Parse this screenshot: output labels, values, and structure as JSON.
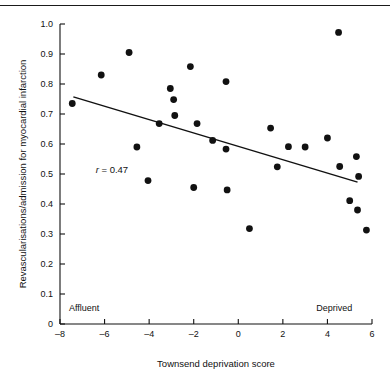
{
  "figure": {
    "has_top_rule": true,
    "background_color": "#ffffff",
    "ink_color": "#111111"
  },
  "chart_data": {
    "type": "scatter",
    "title": "",
    "xlabel": "Townsend deprivation score",
    "ylabel": "Revascularisations/admission for myocardial infarction",
    "xlim": [
      -8,
      6
    ],
    "ylim": [
      0,
      1.0
    ],
    "xticks": [
      -8,
      -6,
      -4,
      -2,
      0,
      2,
      4,
      6
    ],
    "xtick_labels": [
      "–8",
      "–6",
      "–4",
      "–2",
      "0",
      "2",
      "4",
      "6"
    ],
    "yticks": [
      0,
      0.1,
      0.2,
      0.3,
      0.4,
      0.5,
      0.6,
      0.7,
      0.8,
      0.9,
      1.0
    ],
    "ytick_labels": [
      "0",
      "0.1",
      "0.2",
      "0.3",
      "0.4",
      "0.5",
      "0.6",
      "0.7",
      "0.8",
      "0.9",
      "1.0"
    ],
    "grid": false,
    "legend": null,
    "marker": {
      "shape": "circle",
      "color": "#111111",
      "radius_px": 3.4
    },
    "annotations": [
      {
        "name": "correlation-annotation",
        "text_italic": "r",
        "text": " = 0.47",
        "x": -6.4,
        "y": 0.515
      },
      {
        "name": "affluent-label",
        "text": "Affluent",
        "x": -7.6,
        "y": 0.055
      },
      {
        "name": "deprived-label",
        "text": "Deprived",
        "x": 3.5,
        "y": 0.055
      }
    ],
    "trendline": {
      "name": "regression-line",
      "color": "#111111",
      "x_start": -7.4,
      "y_start": 0.757,
      "x_end": 5.35,
      "y_end": 0.473
    },
    "points": [
      {
        "x": -7.45,
        "y": 0.735
      },
      {
        "x": -6.15,
        "y": 0.83
      },
      {
        "x": -4.9,
        "y": 0.905
      },
      {
        "x": -4.55,
        "y": 0.59
      },
      {
        "x": -4.05,
        "y": 0.478
      },
      {
        "x": -3.55,
        "y": 0.668
      },
      {
        "x": -3.05,
        "y": 0.785
      },
      {
        "x": -2.9,
        "y": 0.748
      },
      {
        "x": -2.85,
        "y": 0.695
      },
      {
        "x": -2.15,
        "y": 0.858
      },
      {
        "x": -2.0,
        "y": 0.455
      },
      {
        "x": -1.85,
        "y": 0.668
      },
      {
        "x": -1.15,
        "y": 0.612
      },
      {
        "x": -0.55,
        "y": 0.808
      },
      {
        "x": -0.55,
        "y": 0.583
      },
      {
        "x": -0.5,
        "y": 0.447
      },
      {
        "x": 0.5,
        "y": 0.318
      },
      {
        "x": 1.45,
        "y": 0.653
      },
      {
        "x": 1.75,
        "y": 0.524
      },
      {
        "x": 2.25,
        "y": 0.591
      },
      {
        "x": 3.0,
        "y": 0.59
      },
      {
        "x": 4.0,
        "y": 0.62
      },
      {
        "x": 4.5,
        "y": 0.972
      },
      {
        "x": 4.55,
        "y": 0.525
      },
      {
        "x": 5.0,
        "y": 0.411
      },
      {
        "x": 5.3,
        "y": 0.558
      },
      {
        "x": 5.35,
        "y": 0.38
      },
      {
        "x": 5.4,
        "y": 0.492
      },
      {
        "x": 5.75,
        "y": 0.313
      }
    ]
  }
}
